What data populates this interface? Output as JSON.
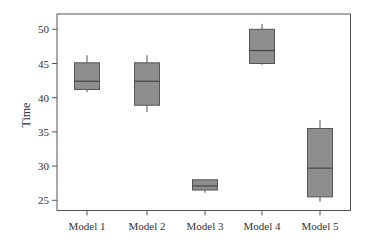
{
  "chart_data": {
    "type": "box",
    "title": "",
    "xlabel": "",
    "ylabel": "Time",
    "categories": [
      "Model 1",
      "Model 2",
      "Model 3",
      "Model 4",
      "Model 5"
    ],
    "series": [
      {
        "name": "Model 1",
        "whisker_low": 40.8,
        "q1": 41.2,
        "median": 42.4,
        "q3": 45.1,
        "whisker_high": 46.2
      },
      {
        "name": "Model 2",
        "whisker_low": 37.9,
        "q1": 38.9,
        "median": 42.4,
        "q3": 45.1,
        "whisker_high": 46.2
      },
      {
        "name": "Model 3",
        "whisker_low": 26.1,
        "q1": 26.5,
        "median": 27.1,
        "q3": 28.0,
        "whisker_high": 28.0
      },
      {
        "name": "Model 4",
        "whisker_low": 44.8,
        "q1": 45.0,
        "median": 46.9,
        "q3": 50.0,
        "whisker_high": 50.8
      },
      {
        "name": "Model 5",
        "whisker_low": 24.8,
        "q1": 25.5,
        "median": 29.7,
        "q3": 35.5,
        "whisker_high": 36.7
      }
    ],
    "yticks": [
      25,
      30,
      35,
      40,
      45,
      50
    ],
    "ylim": [
      23.6,
      52.2
    ],
    "grid": false,
    "legend": "none",
    "colors": {
      "box_fill": "#8e8e8e",
      "box_edge": "#555555",
      "median": "#444444",
      "axis": "#555555"
    }
  }
}
